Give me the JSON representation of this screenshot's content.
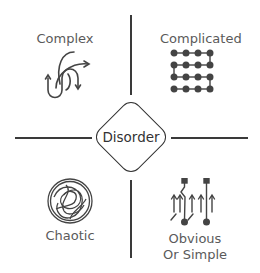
{
  "diagram": {
    "type": "cynefin-framework",
    "center": {
      "label": "Disorder"
    },
    "quadrants": [
      {
        "position": "top-left",
        "label": "Complex",
        "icon": "tangled-arrows-icon"
      },
      {
        "position": "top-right",
        "label": "Complicated",
        "icon": "dot-grid-flow-icon"
      },
      {
        "position": "bottom-left",
        "label": "Chaotic",
        "icon": "scribble-circle-icon"
      },
      {
        "position": "bottom-right",
        "label_line1": "Obvious",
        "label_line2": "Or Simple",
        "icon": "parallel-arrows-icon"
      }
    ],
    "colors": {
      "line": "#3a3a3a",
      "text": "#5a5a5a",
      "background": "#ffffff"
    }
  }
}
